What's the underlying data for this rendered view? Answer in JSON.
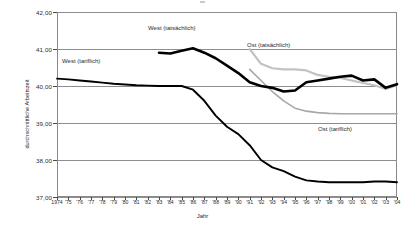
{
  "chart_data": {
    "type": "line",
    "title": "",
    "xlabel": "Jahr",
    "ylabel": "durchschnittliche Arbeitszeit",
    "ylim": [
      37.0,
      42.0
    ],
    "yticks": [
      "37,00",
      "38,00",
      "39,00",
      "40,00",
      "41,00",
      "42,00"
    ],
    "ytick_values": [
      37.0,
      38.0,
      39.0,
      40.0,
      41.0,
      42.0
    ],
    "grid": true,
    "legend_position": "inline-annotations",
    "x": [
      1974,
      1975,
      1976,
      1977,
      1978,
      1979,
      1980,
      1981,
      1982,
      1983,
      1984,
      1985,
      1986,
      1987,
      1988,
      1989,
      1990,
      1991,
      1992,
      1993,
      1994,
      1995,
      1996,
      1997,
      1998,
      1999,
      2000,
      2001,
      2002,
      2003,
      2004
    ],
    "xtick_labels": [
      "1974",
      "'75",
      "'76",
      "'77",
      "'78",
      "'79",
      "'80",
      "'81",
      "'82",
      "'83",
      "'84",
      "'85",
      "'86",
      "'87",
      "'88",
      "'89",
      "'90",
      "'91",
      "'92",
      "'93",
      "'94",
      "'95",
      "'96",
      "'97",
      "'98",
      "'99",
      "'00",
      "'01",
      "'02",
      "'03",
      "'04"
    ],
    "series": [
      {
        "name": "West (tariflich)",
        "color": "#000000",
        "style": "thin-black",
        "values": [
          40.2,
          40.18,
          40.15,
          40.12,
          40.09,
          40.06,
          40.04,
          40.02,
          40.01,
          40.0,
          40.0,
          40.0,
          39.9,
          39.6,
          39.2,
          38.9,
          38.7,
          38.4,
          38.0,
          37.8,
          37.7,
          37.55,
          37.45,
          37.42,
          37.4,
          37.4,
          37.4,
          37.4,
          37.42,
          37.42,
          37.4
        ]
      },
      {
        "name": "West (tatsächlich)",
        "color": "#000000",
        "style": "thick-black",
        "values": [
          null,
          null,
          null,
          null,
          null,
          null,
          null,
          null,
          null,
          40.9,
          40.88,
          40.95,
          41.02,
          40.9,
          40.75,
          40.55,
          40.35,
          40.1,
          40.0,
          39.95,
          39.85,
          39.88,
          40.1,
          40.15,
          40.2,
          40.25,
          40.28,
          40.15,
          40.18,
          39.95,
          40.05
        ]
      },
      {
        "name": "Ost (tatsächlich)",
        "color": "#c2c2c2",
        "style": "thick-gray",
        "values": [
          null,
          null,
          null,
          null,
          null,
          null,
          null,
          null,
          null,
          null,
          null,
          null,
          null,
          null,
          null,
          null,
          null,
          41.0,
          40.6,
          40.48,
          40.45,
          40.45,
          40.42,
          40.3,
          40.25,
          40.22,
          40.15,
          40.08,
          40.02,
          39.92,
          40.02
        ]
      },
      {
        "name": "Ost (tariflich)",
        "color": "#a8a8a8",
        "style": "thin-gray",
        "values": [
          null,
          null,
          null,
          null,
          null,
          null,
          null,
          null,
          null,
          null,
          null,
          null,
          null,
          null,
          null,
          null,
          null,
          40.45,
          40.15,
          39.85,
          39.6,
          39.4,
          39.32,
          39.28,
          39.26,
          39.25,
          39.25,
          39.25,
          39.25,
          39.25,
          39.25
        ]
      }
    ]
  },
  "annotations": {
    "west_tariflich": "West (tariflich)",
    "west_tatsaechlich": "West (tatsächlich)",
    "ost_tatsaechlich": "Ost (tatsächlich)",
    "ost_tariflich": "Ost (tariflich)"
  },
  "axes": {
    "y_title": "durchschnittliche Arbeitszeit",
    "x_title": "Jahr"
  }
}
